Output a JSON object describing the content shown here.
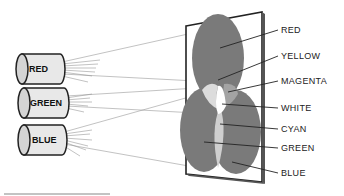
{
  "diagram": {
    "sources": [
      {
        "label": "RED",
        "color": "red"
      },
      {
        "label": "GREEN",
        "color": "green"
      },
      {
        "label": "BLUE",
        "color": "blue"
      }
    ],
    "labels": [
      {
        "text": "RED"
      },
      {
        "text": "YELLOW"
      },
      {
        "text": "MAGENTA"
      },
      {
        "text": "WHITE"
      },
      {
        "text": "CYAN"
      },
      {
        "text": "GREEN"
      },
      {
        "text": "BLUE"
      }
    ],
    "colors": {
      "dark_region": "#7a7a7a",
      "mid_region": "#a3a3a3",
      "light_region": "#d8d8d8",
      "white_region": "#ffffff",
      "cylinder_fill": "#e8e8e8",
      "line": "#222222"
    }
  }
}
